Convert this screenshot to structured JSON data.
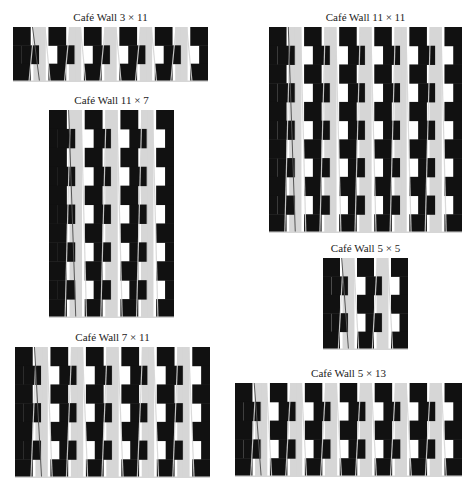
{
  "figure": {
    "colors": {
      "tile": "#111111",
      "mortar": "#d6d6d6",
      "background": "#ffffff",
      "line": "#555555"
    },
    "panels": [
      {
        "id": "p3x11",
        "title": "Café Wall 3 × 11",
        "rows": 3,
        "cols": 11,
        "x": 13,
        "y": 27,
        "w": 195,
        "h": 55
      },
      {
        "id": "p11x11",
        "title": "Café Wall 11 × 11",
        "rows": 11,
        "cols": 11,
        "x": 269,
        "y": 27,
        "w": 193,
        "h": 206
      },
      {
        "id": "p11x7",
        "title": "Café Wall 11 × 7",
        "rows": 11,
        "cols": 7,
        "x": 49,
        "y": 110,
        "w": 125,
        "h": 208
      },
      {
        "id": "p5x5",
        "title": "Café Wall 5 × 5",
        "rows": 5,
        "cols": 5,
        "x": 323,
        "y": 258,
        "w": 85,
        "h": 92
      },
      {
        "id": "p7x11",
        "title": "Café Wall 7 × 11",
        "rows": 7,
        "cols": 11,
        "x": 15,
        "y": 347,
        "w": 195,
        "h": 131
      },
      {
        "id": "p5x13",
        "title": "Café Wall 5 × 13",
        "rows": 5,
        "cols": 13,
        "x": 235,
        "y": 383,
        "w": 227,
        "h": 94
      }
    ]
  }
}
